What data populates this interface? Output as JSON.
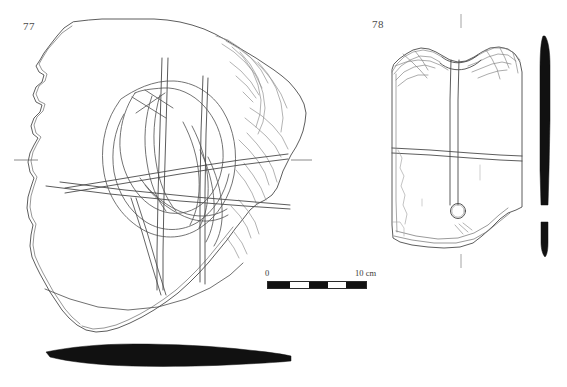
{
  "plate": {
    "width": 567,
    "height": 387,
    "background": "#ffffff",
    "ink_color": "#3c3c3c",
    "fill_black": "#111111",
    "type": "archaeological-artifact-line-drawing"
  },
  "figures": [
    {
      "id": "fig-77",
      "number": "77",
      "description": "Large sherd with incised curvilinear decoration, front view",
      "label_position": {
        "x": 23,
        "y": 20
      },
      "has_section_profile": true,
      "section_orientation": "horizontal",
      "registration_ticks": 2
    },
    {
      "id": "fig-78",
      "number": "78",
      "description": "Rectangular sherd with vertical rib, horizontal groove and circular perforation",
      "label_position": {
        "x": 372,
        "y": 18
      },
      "has_section_profile": true,
      "section_orientation": "vertical",
      "registration_ticks": 2
    }
  ],
  "scale": {
    "zero_label": "0",
    "max_label": "10 cm",
    "unit": "cm",
    "span_cm": 10,
    "bar_width_px": 100,
    "bar_height_px": 8,
    "segments": [
      "dark",
      "light",
      "dark",
      "light",
      "dark"
    ],
    "segment_widths_px": [
      22,
      20,
      19,
      19,
      20
    ],
    "bar_origin": {
      "x": 267,
      "y": 281
    },
    "colors": {
      "dark": "#111111",
      "light": "#ffffff",
      "outline": "#2a2a2a"
    }
  }
}
